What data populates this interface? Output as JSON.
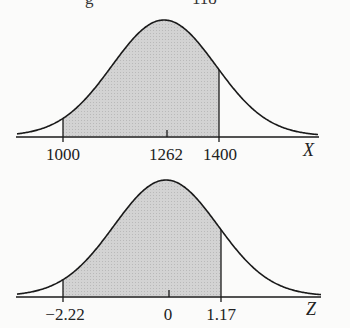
{
  "top_remnant": {
    "left": "g",
    "right": "118"
  },
  "chart_data": [
    {
      "type": "area",
      "title": "",
      "description": "Normal curve for X with shaded region between 1000 and 1400",
      "xlabel": "X",
      "ylabel": "",
      "mean": 1262,
      "shaded_from": 1000,
      "shaded_to": 1400,
      "tick_labels": [
        "1000",
        "1262",
        "1400"
      ],
      "grid": false
    },
    {
      "type": "area",
      "title": "",
      "description": "Standard normal curve for Z with shaded region between -2.22 and 1.17",
      "xlabel": "Z",
      "ylabel": "",
      "mean": 0,
      "shaded_from": -2.22,
      "shaded_to": 1.17,
      "tick_labels": [
        "−2.22",
        "0",
        "1.17"
      ],
      "grid": false
    }
  ],
  "top_chart": {
    "ticks": [
      "1000",
      "1262",
      "1400"
    ],
    "axis": "X"
  },
  "bottom_chart": {
    "ticks": [
      "−2.22",
      "0",
      "1.17"
    ],
    "axis": "Z"
  },
  "colors": {
    "shade": "#cfcfcf",
    "line": "#1a1a1a"
  }
}
